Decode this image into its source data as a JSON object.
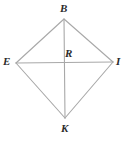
{
  "figure": {
    "name": "kite-BEKI-with-diagonals",
    "background_color": "#ffffff",
    "line_color": "#a8a8a8",
    "label_color": "#2b2b2b",
    "labels": {
      "top": "B",
      "left": "E",
      "right": "I",
      "bottom": "K",
      "center": "R"
    },
    "points": {
      "B": {
        "x": 64,
        "y": 19
      },
      "E": {
        "x": 16,
        "y": 63
      },
      "I": {
        "x": 113,
        "y": 62
      },
      "K": {
        "x": 65,
        "y": 118
      },
      "R": {
        "x": 64,
        "y": 63
      }
    },
    "edges": [
      {
        "name": "side-BE",
        "from": "B",
        "to": "E"
      },
      {
        "name": "side-BI",
        "from": "B",
        "to": "I"
      },
      {
        "name": "side-EK",
        "from": "E",
        "to": "K"
      },
      {
        "name": "side-IK",
        "from": "I",
        "to": "K"
      }
    ],
    "diagonals": [
      {
        "name": "diagonal-BK",
        "from": "B",
        "to": "K"
      },
      {
        "name": "diagonal-EI",
        "from": "E",
        "to": "I"
      }
    ]
  }
}
